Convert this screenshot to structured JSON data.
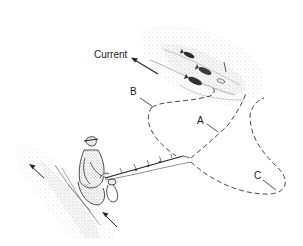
{
  "figure": {
    "labels": {
      "current": "Current",
      "a": "A",
      "b": "B",
      "c": "C"
    },
    "colors": {
      "ink": "#1a1a1a",
      "stipple": "#9a9a9a",
      "background": "#ffffff"
    }
  }
}
